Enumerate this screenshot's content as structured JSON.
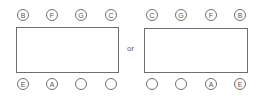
{
  "diagram": {
    "type": "table-seating-arrangement",
    "connector_label": "or",
    "arrangements": [
      {
        "top_seats": [
          "B",
          "F",
          "G",
          "C"
        ],
        "bottom_seats": [
          "E",
          "A",
          "",
          ""
        ]
      },
      {
        "top_seats": [
          "C",
          "G",
          "F",
          "B"
        ],
        "bottom_seats": [
          "",
          "",
          "A",
          "E"
        ]
      }
    ]
  }
}
